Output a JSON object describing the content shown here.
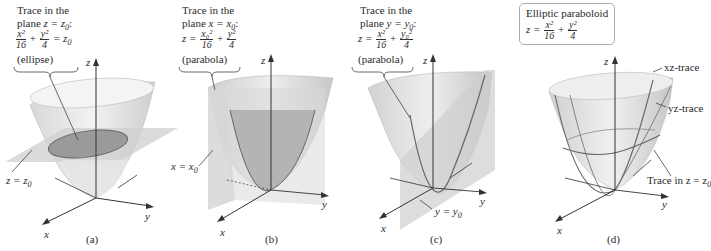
{
  "panels": [
    {
      "id": "a",
      "caption": "(a)",
      "note_line1": "Trace in the",
      "note_line2_prefix": "plane ",
      "note_line2_eq": "z = z",
      "note_line2_sub": "0",
      "note_line2_suffix": ":",
      "eq_num1": "x²",
      "eq_den1": "16",
      "eq_plus": "+",
      "eq_num2": "y²",
      "eq_den2": "4",
      "eq_rhs": "= z",
      "eq_rhs_sub": "0",
      "shape": "(ellipse)",
      "plane_label": "z = z",
      "plane_label_sub": "0",
      "axis_z": "z",
      "axis_x": "x",
      "axis_y": "y"
    },
    {
      "id": "b",
      "caption": "(b)",
      "note_line1": "Trace in the",
      "note_line2_prefix": "plane ",
      "note_line2_eq": "x = x",
      "note_line2_sub": "0",
      "note_line2_suffix": ":",
      "eq_lhs": "z =",
      "eq_num1": "x₀²",
      "eq_den1": "16",
      "eq_plus": "+",
      "eq_num2": "y²",
      "eq_den2": "4",
      "shape": "(parabola)",
      "plane_label": "x = x",
      "plane_label_sub": "0",
      "axis_z": "z",
      "axis_x": "x",
      "axis_y": "y"
    },
    {
      "id": "c",
      "caption": "(c)",
      "note_line1": "Trace in the",
      "note_line2_prefix": "plane ",
      "note_line2_eq": "y = y",
      "note_line2_sub": "0",
      "note_line2_suffix": ":",
      "eq_lhs": "z =",
      "eq_num1": "x²",
      "eq_den1": "16",
      "eq_plus": "+",
      "eq_num2": "y₀²",
      "eq_den2": "4",
      "shape": "(parabola)",
      "plane_label": "y = y",
      "plane_label_sub": "0",
      "axis_z": "z",
      "axis_x": "x",
      "axis_y": "y"
    },
    {
      "id": "d",
      "caption": "(d)",
      "box_title": "Elliptic paraboloid",
      "eq_lhs": "z =",
      "eq_num1": "x²",
      "eq_den1": "16",
      "eq_plus": "+",
      "eq_num2": "y²",
      "eq_den2": "4",
      "label_xz": "xz-trace",
      "label_yz": "yz-trace",
      "label_trace": "Trace in z = z",
      "label_trace_sub": "0",
      "axis_z": "z",
      "axis_x": "x",
      "axis_y": "y"
    }
  ],
  "colors": {
    "surface_light": "#eeeeee",
    "surface_mid": "#c8c8c8",
    "surface_dark": "#a8a8a8",
    "plane": "#d4d4d4",
    "trace": "#666666",
    "axis": "#333333"
  }
}
